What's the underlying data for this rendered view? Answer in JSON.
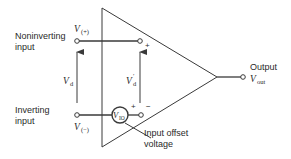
{
  "diagram": {
    "labels": {
      "noninverting_line1": "Noninverting",
      "noninverting_line2": "input",
      "inverting_line1": "Inverting",
      "inverting_line2": "input",
      "output_label": "Output",
      "output_var": "V",
      "output_sub": "out",
      "vplus_var": "V",
      "vplus_sub": "(+)",
      "vminus_var": "V",
      "vminus_sub": "(−)",
      "vd_var": "V",
      "vd_sub": "d",
      "vdprime_var": "V",
      "vdprime_sub": "d",
      "vdprime_prime": "′",
      "vio_var": "V",
      "vio_sub": "IO",
      "plus_top": "+",
      "plus_bottom": "+",
      "minus_bottom": "−",
      "offset_line1": "Input offset",
      "offset_line2": "voltage"
    },
    "colors": {
      "stroke": "#3a3a3a",
      "text": "#2a2a2a",
      "background": "#ffffff"
    }
  }
}
